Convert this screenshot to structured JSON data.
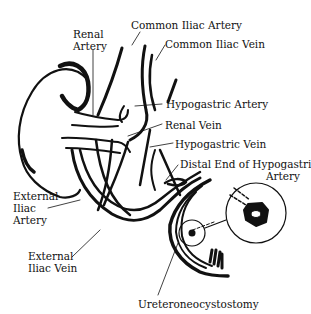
{
  "diagram": {
    "colors": {
      "ink": "#111111",
      "background": "#ffffff"
    },
    "labels": {
      "renal_artery": [
        "Renal",
        "Artery"
      ],
      "common_iliac_artery": "Common Iliac Artery",
      "common_iliac_vein": "Common Iliac Vein",
      "hypogastric_artery": "Hypogastric Artery",
      "renal_vein": "Renal Vein",
      "hypogastric_vein": "Hypogastric Vein",
      "distal_end_hypogastric_artery": [
        "Distal End of Hypogastric",
        "Artery"
      ],
      "external_iliac_artery": [
        "External",
        "Iliac",
        "Artery"
      ],
      "external_iliac_vein": [
        "External",
        "Iliac Vein"
      ],
      "ureteroneocystostomy": "Ureteroneocystostomy"
    }
  }
}
